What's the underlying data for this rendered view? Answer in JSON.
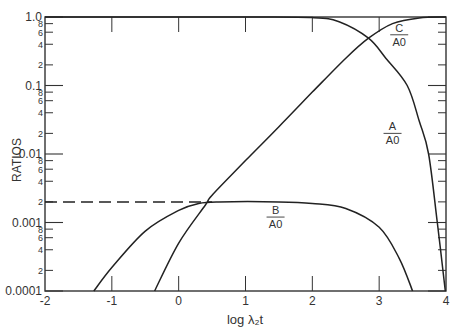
{
  "chart_data": {
    "type": "line",
    "title": "",
    "xlabel": "log λ₂t",
    "ylabel": "RATIOS",
    "xlim": [
      -2,
      4
    ],
    "ylim": [
      0.0001,
      1.0
    ],
    "yscale": "log",
    "grid": false,
    "x_ticks": [
      "-2",
      "-1",
      "0",
      "1",
      "2",
      "3",
      "4"
    ],
    "y_major_ticks": [
      "1.0",
      "0.1",
      "0.01",
      "0.001",
      "0.0001"
    ],
    "y_minor_tick_labels": [
      "8",
      "6",
      "4",
      "2"
    ],
    "series": [
      {
        "name": "A/A0",
        "label_num": "A",
        "label_den": "A0",
        "points": [
          [
            -2,
            1.0
          ],
          [
            0,
            1.0
          ],
          [
            1,
            0.998
          ],
          [
            2,
            0.98
          ],
          [
            2.4,
            0.85
          ],
          [
            2.84,
            0.49
          ],
          [
            3.1,
            0.25
          ],
          [
            3.42,
            0.1
          ],
          [
            3.6,
            0.03
          ],
          [
            3.74,
            0.01
          ],
          [
            3.87,
            0.001
          ],
          [
            3.99,
            0.0001
          ]
        ]
      },
      {
        "name": "B/A0",
        "label_num": "B",
        "label_den": "A0",
        "points": [
          [
            -1.27,
            0.0001
          ],
          [
            -1.0,
            0.00022
          ],
          [
            -0.5,
            0.00075
          ],
          [
            0.0,
            0.0015
          ],
          [
            0.3,
            0.0019
          ],
          [
            0.6,
            0.002
          ],
          [
            1.5,
            0.002
          ],
          [
            2.0,
            0.0019
          ],
          [
            2.5,
            0.0016
          ],
          [
            3.0,
            0.00085
          ],
          [
            3.3,
            0.0003
          ],
          [
            3.5,
            0.0001
          ]
        ]
      },
      {
        "name": "C/A0",
        "label_num": "C",
        "label_den": "A0",
        "points": [
          [
            -0.36,
            0.0001
          ],
          [
            0.0,
            0.0005
          ],
          [
            0.4,
            0.0018
          ],
          [
            0.5,
            0.0025
          ],
          [
            1.0,
            0.008
          ],
          [
            1.5,
            0.025
          ],
          [
            2.0,
            0.08
          ],
          [
            2.5,
            0.25
          ],
          [
            2.84,
            0.49
          ],
          [
            3.2,
            0.8
          ],
          [
            3.6,
            0.97
          ],
          [
            4.0,
            1.0
          ]
        ]
      },
      {
        "name": "B plateau reference (dashed)",
        "style": "dashed",
        "points": [
          [
            -2,
            0.002
          ],
          [
            0.5,
            0.002
          ]
        ]
      }
    ],
    "annotations": [
      {
        "text": "C/A0",
        "x": 3.3,
        "y": 0.55
      },
      {
        "text": "A/A0",
        "x": 3.2,
        "y": 0.02
      },
      {
        "text": "B/A0",
        "x": 1.45,
        "y": 0.0012
      }
    ]
  }
}
